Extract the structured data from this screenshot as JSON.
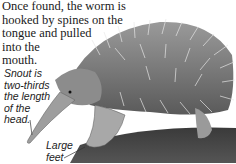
{
  "captions": {
    "top": [
      "Once found, the worm is",
      "hooked by spines on the",
      "tongue and pulled",
      "into the",
      "mouth."
    ],
    "snout": [
      "Snout is",
      "two-thirds",
      "the length",
      "of the",
      "head."
    ],
    "feet": [
      "Large",
      "feet"
    ]
  },
  "image": {
    "subject": "echidna",
    "style": "grayscale photograph illustration"
  }
}
